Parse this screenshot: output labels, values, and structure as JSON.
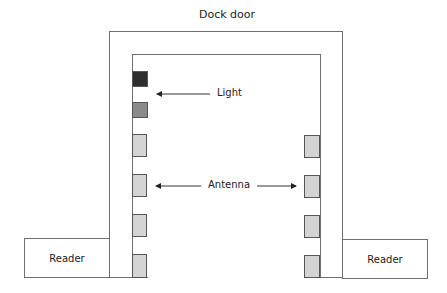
{
  "diagram": {
    "title": "Dock door",
    "labels": {
      "light": "Light",
      "antenna": "Antenna",
      "reader_left": "Reader",
      "reader_right": "Reader"
    },
    "colors": {
      "line": "#6f6f6f",
      "light_top": "#2e2e2e",
      "light_bottom": "#8a8a8a",
      "antenna": "#d4d4d4"
    },
    "components": {
      "lights": [
        {
          "name": "light-dark",
          "color": "#2e2e2e"
        },
        {
          "name": "light-grey",
          "color": "#8a8a8a"
        }
      ],
      "antennas_left": 4,
      "antennas_right": 4,
      "readers": 2
    }
  }
}
